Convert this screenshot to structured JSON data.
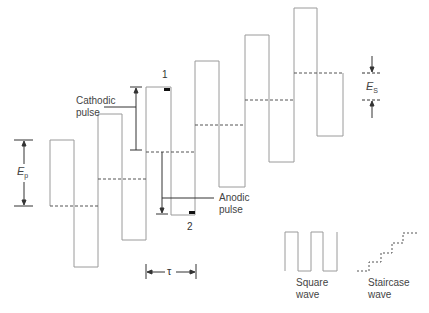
{
  "diagram": {
    "labels": {
      "cathodic_pulse": [
        "Cathodic",
        "pulse"
      ],
      "anodic_pulse": [
        "Anodic",
        "pulse"
      ],
      "point_1": "1",
      "point_2": "2",
      "pulse_amplitude": "E",
      "pulse_amplitude_sub": "p",
      "step_height": "E",
      "step_height_sub": "S",
      "period": "τ",
      "square_wave": [
        "Square",
        "wave"
      ],
      "staircase_wave": [
        "Staircase",
        "wave"
      ]
    },
    "colors": {
      "waveform": "#9a9a9a",
      "staircase": "#555555",
      "annotation": "#333333",
      "marker": "#111111"
    },
    "waveform": {
      "pulses": [
        {
          "x_start": 50,
          "x_mid": 74,
          "x_end": 99,
          "top": 140,
          "bottom": 267,
          "base": 206
        },
        {
          "x_start": 99,
          "x_mid": 122,
          "x_end": 146,
          "top": 114,
          "bottom": 240,
          "base": 179
        },
        {
          "x_start": 146,
          "x_mid": 171,
          "x_end": 195,
          "top": 87,
          "bottom": 215,
          "base": 152
        },
        {
          "x_start": 195,
          "x_mid": 219,
          "x_end": 245,
          "top": 61,
          "bottom": 187,
          "base": 125
        },
        {
          "x_start": 245,
          "x_mid": 269,
          "x_end": 294,
          "top": 35,
          "bottom": 162,
          "base": 100
        },
        {
          "x_start": 294,
          "x_mid": 317,
          "x_end": 343,
          "top": 8,
          "bottom": 136,
          "base": 73
        }
      ]
    }
  }
}
